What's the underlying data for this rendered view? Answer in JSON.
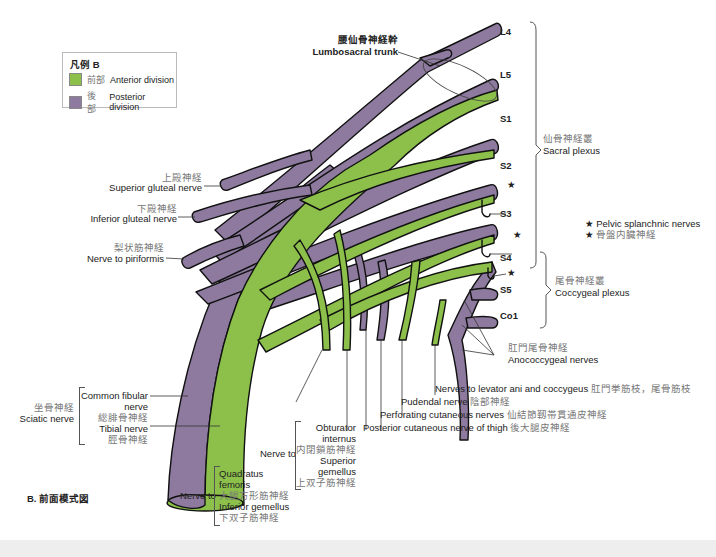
{
  "legend": {
    "title": "凡例 B",
    "items": [
      {
        "jp": "前部",
        "en": "Anterior division",
        "color": "#8cc04a"
      },
      {
        "jp": "後部",
        "en": "Posterior division",
        "color": "#8d7a9e"
      }
    ]
  },
  "colors": {
    "anterior": "#8cc04a",
    "posterior": "#8d7a9e",
    "outline": "#111111"
  },
  "roots": [
    "L4",
    "L5",
    "S1",
    "S2",
    "S3",
    "S4",
    "S5",
    "Co1"
  ],
  "lumbosacral_trunk": {
    "jp": "腰仙骨神経幹",
    "en": "Lumbosacral trunk"
  },
  "sacral_plexus": {
    "jp": "仙骨神経叢",
    "en": "Sacral plexus"
  },
  "coccygeal_plexus": {
    "jp": "尾骨神経叢",
    "en": "Coccygeal plexus"
  },
  "pelvic_splanchnic": {
    "star": "★",
    "en": "Pelvic splanchnic nerves",
    "jp": "骨盤内臓神経"
  },
  "anococcygeal": {
    "jp": "肛門尾骨神経",
    "en": "Anococcygeal nerves"
  },
  "left_labels": {
    "superior_gluteal": {
      "jp": "上殿神経",
      "en": "Superior gluteal nerve"
    },
    "inferior_gluteal": {
      "jp": "下殿神経",
      "en": "Inferior gluteal nerve"
    },
    "piriformis": {
      "jp": "梨状筋神経",
      "en": "Nerve to piriformis"
    }
  },
  "sciatic": {
    "jp": "坐骨神経",
    "en": "Sciatic nerve",
    "common_fibular_en1": "Common fibular",
    "common_fibular_en2": "nerve",
    "common_fibular_jp": "総腓骨神経",
    "tibial_en": "Tibial nerve",
    "tibial_jp": "脛骨神経"
  },
  "bottom_labels": {
    "levator": {
      "en": "Nerves to levator ani and coccygeus",
      "jp": "肛門挙筋枝，尾骨筋枝"
    },
    "pudendal": {
      "en": "Pudendal nerve",
      "jp": "陰部神経"
    },
    "perforating": {
      "en": "Perforating cutaneous nerves",
      "jp": "仙結節靱帯貫通皮神経"
    },
    "post_cutaneous": {
      "en": "Posterior cutaneous nerve of thigh",
      "jp": "後大腿皮神経"
    }
  },
  "nerve_to_1": {
    "prefix": "Nerve to",
    "obturator_en1": "Obturator",
    "obturator_en2": "internus",
    "obturator_jp": "内閉鎖筋神経",
    "superior_en1": "Superior",
    "superior_en2": "gemellus",
    "superior_jp": "上双子筋神経"
  },
  "nerve_to_2": {
    "prefix": "Nerve to",
    "quadratus_en1": "Quadratus",
    "quadratus_en2": "femoris",
    "quadratus_jp": "大腿方形筋神経",
    "inferior_en": "Inferior gemellus",
    "inferior_jp": "下双子筋神経"
  },
  "figure_caption": "B. 前面模式図"
}
